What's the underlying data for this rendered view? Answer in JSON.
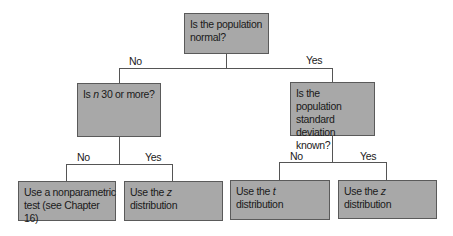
{
  "diagram": {
    "type": "decision-tree",
    "nodes": {
      "root": {
        "pre": "Is the population normal?",
        "italic": "",
        "post": ""
      },
      "left": {
        "pre": "Is ",
        "italic": "n",
        "post": " 30 or more?"
      },
      "right": {
        "pre": "Is the population standard deviation known?",
        "italic": "",
        "post": ""
      },
      "leaf1": {
        "pre": "Use a nonparametric test (see Chapter 16)",
        "italic": "",
        "post": ""
      },
      "leaf2": {
        "pre": "Use the ",
        "italic": "z",
        "post": " distribution"
      },
      "leaf3": {
        "pre": "Use the ",
        "italic": "t",
        "post": " distribution"
      },
      "leaf4": {
        "pre": "Use the ",
        "italic": "z",
        "post": " distribution"
      }
    },
    "edge_labels": {
      "root_no": "No",
      "root_yes": "Yes",
      "left_no": "No",
      "left_yes": "Yes",
      "right_no": "No",
      "right_yes": "Yes"
    },
    "colors": {
      "box_fill": "#a8a8a8",
      "box_border": "#5a5a5a",
      "line": "#555555",
      "text": "#1a1a1a"
    }
  }
}
